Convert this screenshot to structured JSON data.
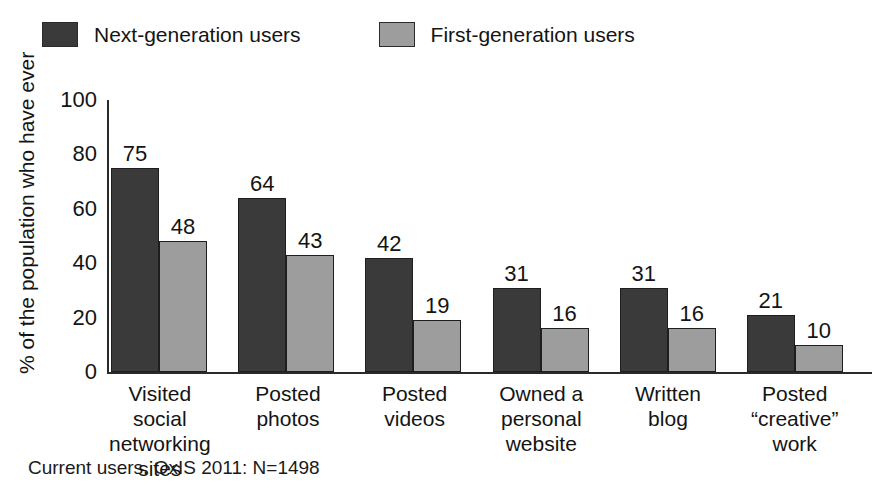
{
  "chart_data": {
    "type": "bar",
    "title": "",
    "xlabel": "",
    "ylabel": "% of the population who have ever",
    "ylim": [
      0,
      100
    ],
    "yticks": [
      100,
      80,
      60,
      40,
      20,
      0
    ],
    "grid": false,
    "legend_position": "top-left",
    "categories": [
      "Visited social networking sites",
      "Posted photos",
      "Posted videos",
      "Owned a personal website",
      "Written blog",
      "Posted “creative” work"
    ],
    "category_lines": [
      [
        "Visited social",
        "networking",
        "sites"
      ],
      [
        "Posted",
        "photos"
      ],
      [
        "Posted",
        "videos"
      ],
      [
        "Owned a",
        "personal",
        "website"
      ],
      [
        "Written",
        "blog"
      ],
      [
        "Posted",
        "“creative”",
        "work"
      ]
    ],
    "series": [
      {
        "name": "Next-generation users",
        "color": "#3a3a3a",
        "values": [
          75,
          64,
          42,
          31,
          31,
          21
        ]
      },
      {
        "name": "First-generation users",
        "color": "#9d9d9d",
        "values": [
          48,
          43,
          19,
          16,
          16,
          10
        ]
      }
    ],
    "footnote": "Current users. OxIS 2011: N=1498"
  },
  "legend": {
    "entries": [
      {
        "label": "Next-generation users",
        "color": "#3a3a3a"
      },
      {
        "label": "First-generation users",
        "color": "#9d9d9d"
      }
    ]
  },
  "axis": {
    "y_title": "% of the population who have ever",
    "y_ticks": [
      "100",
      "80",
      "60",
      "40",
      "20",
      "0"
    ]
  },
  "footnote": {
    "text": "Current users. OxIS 2011: N=1498"
  }
}
